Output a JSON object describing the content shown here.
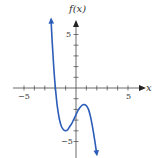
{
  "chart_data": {
    "type": "line",
    "title": "",
    "xlabel": "x",
    "ylabel": "f(x)",
    "xlim": [
      -6,
      6.3
    ],
    "ylim": [
      -6.5,
      6.5
    ],
    "x_tick_labels": [
      {
        "value": -5,
        "label": "−5"
      },
      {
        "value": 5,
        "label": "5"
      }
    ],
    "y_tick_labels": [
      {
        "value": 5,
        "label": "5"
      },
      {
        "value": -5,
        "label": "−5"
      }
    ],
    "x_ticks": [
      -5,
      -4,
      -3,
      -2,
      -1,
      1,
      2,
      3,
      4,
      5
    ],
    "y_ticks": [
      -5,
      -4,
      -3,
      -2,
      -1,
      1,
      2,
      3,
      4,
      5
    ],
    "grid": false,
    "series": [
      {
        "name": "f(x)",
        "color": "#2b5cb8",
        "end_arrows": true,
        "points": [
          [
            -2.4,
            6.4
          ],
          [
            -2.3,
            4.5
          ],
          [
            -2.2,
            2.9
          ],
          [
            -2.1,
            1.4
          ],
          [
            -2.0,
            0.2
          ],
          [
            -1.9,
            -0.8
          ],
          [
            -1.8,
            -1.7
          ],
          [
            -1.6,
            -2.9
          ],
          [
            -1.4,
            -3.6
          ],
          [
            -1.2,
            -3.9
          ],
          [
            -1.0,
            -4.0
          ],
          [
            -0.8,
            -3.9
          ],
          [
            -0.6,
            -3.6
          ],
          [
            -0.4,
            -3.3
          ],
          [
            -0.2,
            -2.9
          ],
          [
            0.0,
            -2.5
          ],
          [
            0.2,
            -2.1
          ],
          [
            0.4,
            -1.8
          ],
          [
            0.6,
            -1.6
          ],
          [
            0.8,
            -1.55
          ],
          [
            1.0,
            -1.65
          ],
          [
            1.2,
            -2.0
          ],
          [
            1.4,
            -2.7
          ],
          [
            1.6,
            -3.7
          ],
          [
            1.8,
            -4.9
          ],
          [
            2.0,
            -6.2
          ]
        ]
      }
    ]
  },
  "labels": {
    "y_axis": "f(x)",
    "x_axis": "x",
    "x_neg5": "−5",
    "x_pos5": "5",
    "y_pos5": "5",
    "y_neg5": "−5"
  }
}
